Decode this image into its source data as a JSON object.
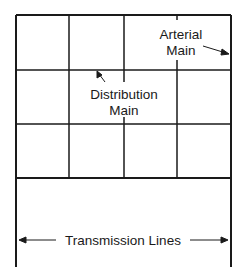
{
  "diagram": {
    "type": "grid water distribution network",
    "labels": {
      "arterial_main_line1": "Arterial",
      "arterial_main_line2": "Main",
      "distribution_main_line1": "Distribution",
      "distribution_main_line2": "Main",
      "transmission_lines": "Transmission Lines"
    },
    "grid": {
      "columns": 4,
      "rows": 3
    },
    "colors": {
      "line": "#1a1a1a",
      "background": "#ffffff"
    }
  }
}
